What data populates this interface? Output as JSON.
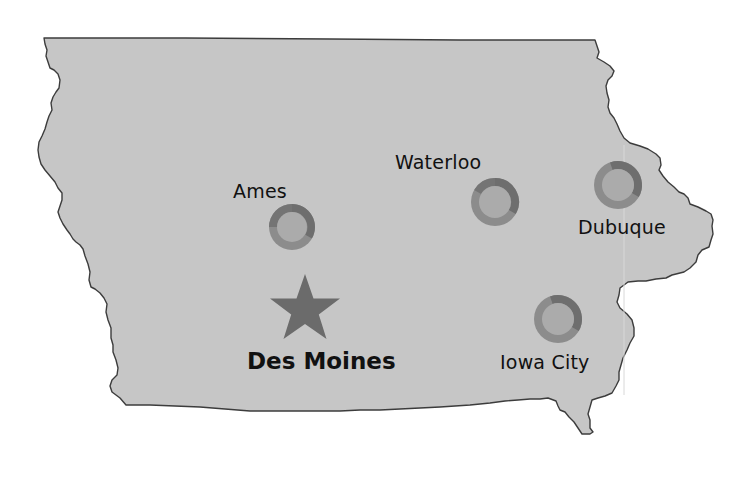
{
  "map": {
    "region": "Iowa",
    "colors": {
      "state_fill": "#c6c6c6",
      "state_border": "#3c3c3c",
      "background": "#ffffff",
      "marker_ring_dark": "#6e6e6e",
      "marker_ring_light": "#8c8c8c",
      "marker_center": "#ababab",
      "capital_star": "#6b6b6b",
      "label_text": "#111111"
    },
    "capital": {
      "name": "Des Moines",
      "icon": "star-icon"
    },
    "cities": [
      {
        "name": "Ames",
        "icon": "ring-marker-icon"
      },
      {
        "name": "Waterloo",
        "icon": "ring-marker-icon"
      },
      {
        "name": "Dubuque",
        "icon": "ring-marker-icon"
      },
      {
        "name": "Iowa City",
        "icon": "ring-marker-icon"
      }
    ]
  }
}
